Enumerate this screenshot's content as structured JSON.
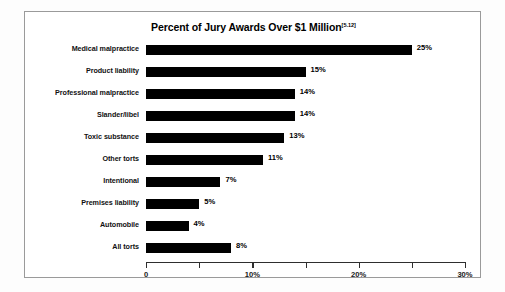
{
  "chart_data": {
    "type": "bar",
    "orientation": "horizontal",
    "title": "Percent of Jury Awards Over $1 Million",
    "title_superscript": "[5.12]",
    "categories": [
      "Medical malpractice",
      "Product liability",
      "Professional malpractice",
      "Slander/libel",
      "Toxic substance",
      "Other torts",
      "Intentional",
      "Premises liability",
      "Automobile",
      "All torts"
    ],
    "values": [
      25,
      15,
      14,
      14,
      13,
      11,
      7,
      5,
      4,
      8
    ],
    "value_labels": [
      "25%",
      "15%",
      "14%",
      "14%",
      "13%",
      "11%",
      "7%",
      "5%",
      "4%",
      "8%"
    ],
    "xlabel": "",
    "ylabel": "",
    "xlim": [
      0,
      30
    ],
    "x_ticks": [
      0,
      5,
      10,
      15,
      20,
      25,
      30
    ],
    "x_tick_labels": [
      "0",
      "",
      "10%",
      "",
      "20%",
      "",
      "30%"
    ],
    "grid": false,
    "legend": null,
    "bar_color": "#000000",
    "axis_color": "#2e2e2e",
    "frame_color": "#9a9a9a",
    "background": "#ffffff"
  }
}
